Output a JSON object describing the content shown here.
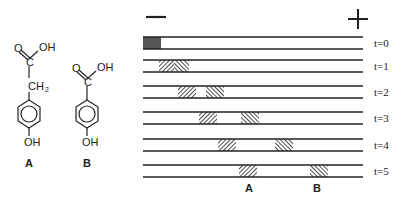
{
  "molecules": [
    {
      "label": "A",
      "groups": {
        "top_left": "O",
        "top_right": "OH",
        "carbon": "C",
        "linker": "CH",
        "linker_sub": "2",
        "bottom": "OH"
      }
    },
    {
      "label": "B",
      "groups": {
        "top_left": "O",
        "top_right": "OH",
        "carbon": "C",
        "bottom": "OH"
      }
    }
  ],
  "electrophoresis": {
    "negative_symbol": "−",
    "positive_symbol": "+",
    "lanes": [
      {
        "label": "t=0",
        "bands": [
          {
            "x": 143,
            "w": 18,
            "style": "solid"
          }
        ]
      },
      {
        "label": "t=1",
        "bands": [
          {
            "x": 159,
            "w": 15,
            "style": "fwd"
          },
          {
            "x": 174,
            "w": 15,
            "style": "back"
          }
        ]
      },
      {
        "label": "t=2",
        "bands": [
          {
            "x": 178,
            "w": 18,
            "style": "fwd"
          },
          {
            "x": 206,
            "w": 18,
            "style": "back"
          }
        ]
      },
      {
        "label": "t=3",
        "bands": [
          {
            "x": 199,
            "w": 18,
            "style": "fwd"
          },
          {
            "x": 241,
            "w": 18,
            "style": "back"
          }
        ]
      },
      {
        "label": "t=4",
        "bands": [
          {
            "x": 218,
            "w": 18,
            "style": "fwd"
          },
          {
            "x": 275,
            "w": 18,
            "style": "back"
          }
        ]
      },
      {
        "label": "t=5",
        "bands": [
          {
            "x": 239,
            "w": 18,
            "style": "fwd"
          },
          {
            "x": 310,
            "w": 18,
            "style": "back"
          }
        ]
      }
    ],
    "band_labels": [
      {
        "text": "A",
        "x": 249
      },
      {
        "text": "B",
        "x": 317
      }
    ]
  }
}
